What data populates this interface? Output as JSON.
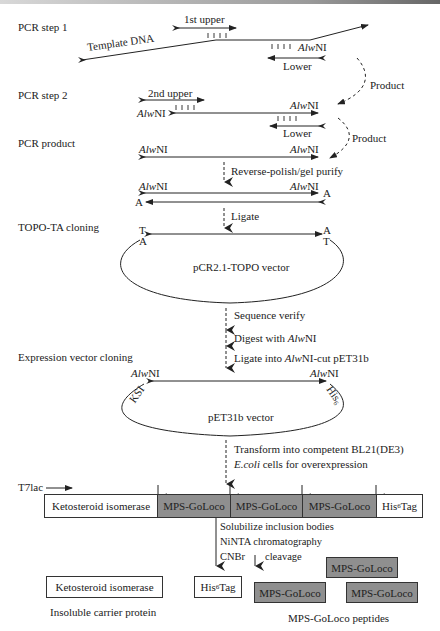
{
  "figure": {
    "steps": {
      "pcr1": "PCR step 1",
      "pcr2": "PCR step 2",
      "pcr_product": "PCR product",
      "topo": "TOPO-TA cloning",
      "expression": "Expression vector cloning"
    },
    "primers": {
      "first_upper": "1st upper",
      "second_upper": "2nd upper",
      "lower": "Lower",
      "template": "Template DNA"
    },
    "site": {
      "italic": "Alw",
      "roman": "NI"
    },
    "product_label": "Product",
    "actions": {
      "reverse_polish": "Reverse-polish/gel purify",
      "ligate": "Ligate",
      "sequence_verify": "Sequence verify",
      "digest_prefix": "Digest with ",
      "ligate_into_prefix": "Ligate into ",
      "ligate_into_suffix": "-cut pET31b",
      "transform_line1": "Transform into competent BL21(DE3)",
      "transform_line2_italic": "E.coli",
      "transform_line2_rest": " cells for overexpression",
      "solubilize": "Solubilize inclusion bodies",
      "ninta": "NiNTA chromatography",
      "cnbr": "CNBr",
      "cleavage": "cleavage"
    },
    "overhangs": {
      "A": "A",
      "T": "T"
    },
    "vectors": {
      "topo": "pCR2.1-TOPO vector",
      "pet": "pET31b vector",
      "ksi": "KSI",
      "his_prefix": "His",
      "his_sub": "6"
    },
    "promoter": "T7lac",
    "construct": [
      {
        "label": "Ketosteroid isomerase",
        "style": "white"
      },
      {
        "label": "MPS-GoLoco",
        "style": "grey"
      },
      {
        "label": "MPS-GoLoco",
        "style": "grey"
      },
      {
        "label": "MPS-GoLoco",
        "style": "grey"
      },
      {
        "label": "His",
        "sub": "6",
        "suffix": " Tag",
        "style": "white"
      }
    ],
    "products": {
      "ksi_box": "Ketosteroid isomerase",
      "carrier_caption": "Insoluble carrier protein",
      "his_prefix": "His",
      "his_sub": "6",
      "his_suffix": " Tag",
      "peptide": "MPS-GoLoco",
      "peptides_caption": "MPS-GoLoco peptides"
    }
  }
}
